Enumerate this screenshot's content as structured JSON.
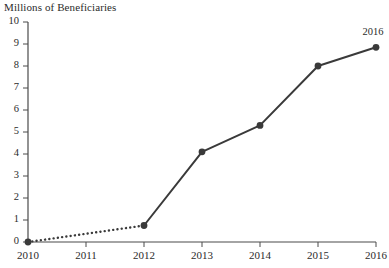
{
  "chart_data": {
    "type": "line",
    "title": "Millions of Beneficiaries",
    "xlabel": "",
    "ylabel": "",
    "x": [
      2010,
      2011,
      2012,
      2013,
      2014,
      2015,
      2016
    ],
    "categories": [
      "2010",
      "2011",
      "2012",
      "2013",
      "2014",
      "2015",
      "2016"
    ],
    "series": [
      {
        "name": "Beneficiaries",
        "x": [
          2010,
          2012,
          2013,
          2014,
          2015,
          2016
        ],
        "values": [
          0.0,
          0.75,
          4.1,
          5.3,
          8.0,
          8.85
        ]
      }
    ],
    "segments": [
      {
        "from": 2010,
        "to": 2012,
        "style": "dotted"
      },
      {
        "from": 2012,
        "to": 2016,
        "style": "solid"
      }
    ],
    "annotations": [
      {
        "text": "2016",
        "x": 2016,
        "y": 8.85,
        "position": "above"
      }
    ],
    "xlim": [
      2010,
      2016
    ],
    "ylim": [
      0,
      10
    ],
    "yticks": [
      0,
      1,
      2,
      3,
      4,
      5,
      6,
      7,
      8,
      9,
      10
    ],
    "ytick_labels": [
      "0",
      "1",
      "2",
      "3",
      "4",
      "5",
      "6",
      "7",
      "8",
      "9",
      "10"
    ],
    "xticks": [
      2010,
      2011,
      2012,
      2013,
      2014,
      2015,
      2016
    ],
    "xtick_labels": [
      "2010",
      "2011",
      "2012",
      "2013",
      "2014",
      "2015",
      "2016"
    ],
    "grid": false,
    "legend": null,
    "colors": {
      "line": "#3a3a3a",
      "marker": "#3a3a3a",
      "axis": "#4a4a4a",
      "text": "#2b2b2b",
      "background": "#ffffff"
    },
    "marker": "circle",
    "line_width": 2
  }
}
